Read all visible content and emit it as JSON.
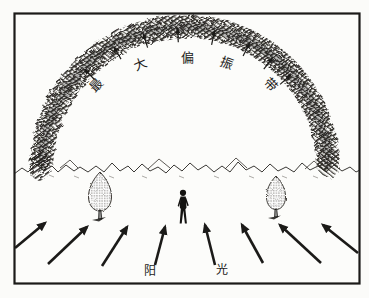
{
  "diagram": {
    "band_label": {
      "text": "最大偏振带",
      "chars": [
        "最",
        "大",
        "偏",
        "振",
        "带"
      ]
    },
    "sunlight_label": {
      "text": "阳光",
      "chars": [
        "阳",
        "光"
      ]
    },
    "polarization_arrows_count": 8,
    "sunlight_arrows_count": 8,
    "colors": {
      "ink": "#1b1a18",
      "paper": "#fbfbf9"
    }
  }
}
